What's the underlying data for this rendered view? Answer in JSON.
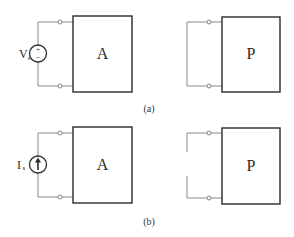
{
  "figure": {
    "panel_a": {
      "caption": "(a)",
      "left_circuit": {
        "source_type": "voltage-source",
        "source_label_main": "V",
        "source_label_sub": "s",
        "source_plus": "+",
        "source_minus": "−",
        "network_label": "A"
      },
      "right_circuit": {
        "connection": "short-circuit",
        "network_label": "P"
      }
    },
    "panel_b": {
      "caption": "(b)",
      "left_circuit": {
        "source_type": "current-source",
        "source_label_main": "I",
        "source_label_sub": "s",
        "network_label": "A"
      },
      "right_circuit": {
        "connection": "open-circuit",
        "network_label": "P"
      }
    },
    "colors": {
      "wire": "#8a8a8a",
      "box_outline": "#2a2a2a",
      "text": "#2a2a2a",
      "background": "#ffffff"
    }
  }
}
